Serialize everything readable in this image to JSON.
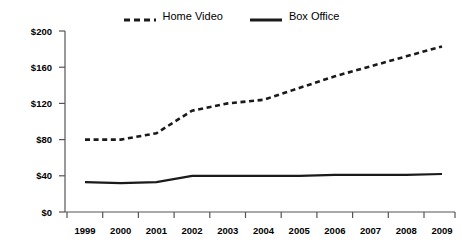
{
  "chart_data": {
    "type": "line",
    "title": "",
    "xlabel": "",
    "ylabel": "",
    "categories": [
      "1999",
      "2000",
      "2001",
      "2002",
      "2003",
      "2004",
      "2005",
      "2006",
      "2007",
      "2008",
      "2009"
    ],
    "series": [
      {
        "name": "Home Video",
        "style": "dashed",
        "color": "#1a1a1a",
        "values": [
          80,
          80,
          87,
          112,
          120,
          124,
          137,
          150,
          161,
          172,
          183
        ]
      },
      {
        "name": "Box Office",
        "style": "solid",
        "color": "#1a1a1a",
        "values": [
          33,
          32,
          33,
          40,
          40,
          40,
          40,
          41,
          41,
          41,
          42
        ]
      }
    ],
    "ylim": [
      0,
      200
    ],
    "yticks": [
      0,
      40,
      80,
      120,
      160,
      200
    ],
    "ytick_labels": [
      "$0",
      "$40",
      "$80",
      "$120",
      "$160",
      "$200"
    ],
    "grid": false,
    "legend_position": "top-center"
  },
  "legend": {
    "entries": [
      {
        "label": "Home Video",
        "swatch": "dashed-line-swatch"
      },
      {
        "label": "Box Office",
        "swatch": "solid-line-swatch"
      }
    ]
  },
  "axes": {
    "y_tick_labels": [
      "$200",
      "$160",
      "$120",
      "$80",
      "$40",
      "$0"
    ],
    "x_tick_labels": [
      "1999",
      "2000",
      "2001",
      "2002",
      "2003",
      "2004",
      "2005",
      "2006",
      "2007",
      "2008",
      "2009"
    ]
  }
}
